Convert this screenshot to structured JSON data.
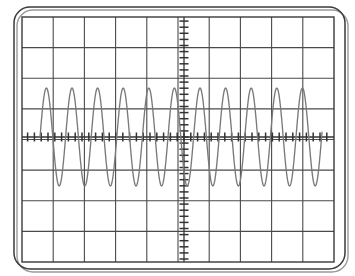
{
  "instrument": {
    "name": "oscilloscope-display",
    "display_type": "graticule-crt"
  },
  "bezel": {
    "name": "scope-bezel",
    "corner_radius": 16,
    "stroke_color": "#3a3a3a",
    "shadow_color": "#9a9a9a",
    "x": 14,
    "y": 7,
    "width": 331,
    "height": 262
  },
  "graticule": {
    "name": "graticule-grid",
    "x": 22,
    "y": 17,
    "width": 312,
    "height": 245,
    "divisions_horizontal": 9,
    "divisions_vertical": 7,
    "grid_color": "#4a4a4a",
    "grid_line_width": 1.1,
    "border_color": "#3a3a3a",
    "border_line_width": 1.4,
    "background": "#ffffff"
  },
  "axes": {
    "name": "center-axes",
    "center_x": 184,
    "center_y": 137,
    "axis_color": "#333333",
    "axis_line_width": 1.3,
    "minor_ticks_per_division": 5,
    "horizontal_tick_length": 9,
    "vertical_tick_length": 9,
    "horizontal_tick_spacing": 6.8,
    "vertical_tick_spacing": 6.1
  },
  "chart_data": {
    "type": "line",
    "title": "",
    "xlabel": "",
    "ylabel": "",
    "trace_name": "CH1",
    "trace_color": "#7a7a7a",
    "trace_line_width": 1.35,
    "waveform": "sine",
    "cycles_visible": 11,
    "amplitude_divisions": 2.0,
    "period_px": 25.6,
    "amplitude_px": 49,
    "phase_deg": 0,
    "x_start_px": 40,
    "x_end_px": 322,
    "baseline_y_px": 137,
    "peak_y_px": 88,
    "trough_y_px": 186,
    "xlim": [
      -5,
      5
    ],
    "ylim": [
      -4,
      4
    ],
    "grid": true,
    "legend": "none",
    "samples_x": [
      40,
      46,
      53,
      59,
      66,
      72,
      78,
      85,
      91,
      98,
      104,
      110,
      117,
      123,
      130,
      136,
      142,
      149,
      155,
      162,
      168,
      174,
      181,
      184,
      190,
      197,
      203,
      210,
      216,
      222,
      229,
      235,
      242,
      248,
      254,
      261,
      267,
      274,
      280,
      286,
      293,
      299,
      306,
      312,
      318,
      322
    ],
    "samples_y": [
      137,
      88,
      137,
      186,
      137,
      88,
      137,
      186,
      137,
      88,
      137,
      186,
      137,
      88,
      137,
      186,
      137,
      88,
      137,
      186,
      137,
      88,
      137,
      137,
      186,
      137,
      88,
      137,
      186,
      137,
      88,
      137,
      186,
      137,
      88,
      137,
      186,
      137,
      88,
      137,
      186,
      137,
      88,
      137,
      186,
      137
    ]
  }
}
